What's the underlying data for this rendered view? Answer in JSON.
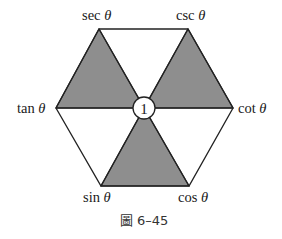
{
  "figure": {
    "caption_prefix": "圖",
    "caption_number": "6–45",
    "center_label": "1",
    "theta": "θ",
    "vertices": [
      {
        "name": "sec",
        "label": "sec",
        "x": 99,
        "y": 29
      },
      {
        "name": "csc",
        "label": "csc",
        "x": 188,
        "y": 29
      },
      {
        "name": "cot",
        "label": "cot",
        "x": 233,
        "y": 108
      },
      {
        "name": "cos",
        "label": "cos",
        "x": 189,
        "y": 186
      },
      {
        "name": "sin",
        "label": "sin",
        "x": 101,
        "y": 186
      },
      {
        "name": "tan",
        "label": "tan",
        "x": 56,
        "y": 108
      }
    ],
    "center": {
      "x": 144,
      "y": 108,
      "r": 11
    },
    "shaded_triangles": [
      [
        "sec",
        "tan",
        "center"
      ],
      [
        "csc",
        "cot",
        "center"
      ],
      [
        "sin",
        "cos",
        "center"
      ]
    ],
    "colors": {
      "shade": "#8e8e8e",
      "stroke": "#222222",
      "background": "#ffffff"
    }
  }
}
